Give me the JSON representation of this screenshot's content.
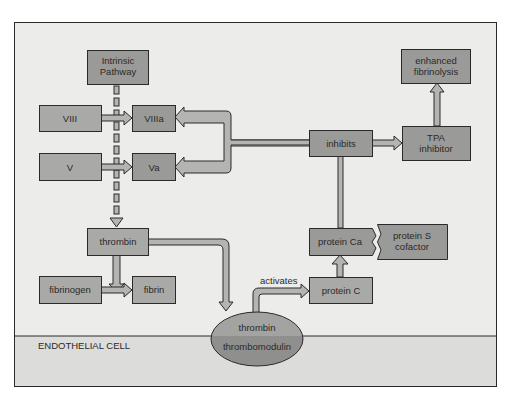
{
  "diagram": {
    "colors": {
      "background": "#ffffff",
      "panel": "#ececea",
      "endothelial_region": "#dcdcda",
      "box_fill": "#9a9a98",
      "box_fill_light": "#a9a9a7",
      "arrow_fill": "#b4b4b2",
      "stroke": "#2a2a2a",
      "ellipse_top": "#a3a3a1",
      "ellipse_bottom": "#8f8f8d"
    },
    "nodes": {
      "intrinsic_pathway": {
        "line1": "Intrinsic",
        "line2": "Pathway"
      },
      "viii": {
        "label": "VIII"
      },
      "viiia": {
        "label": "VIIIa"
      },
      "v": {
        "label": "V"
      },
      "va": {
        "label": "Va"
      },
      "thrombin": {
        "label": "thrombin"
      },
      "fibrinogen": {
        "label": "fibrinogen"
      },
      "fibrin": {
        "label": "fibrin"
      },
      "thrombin_complex": {
        "top": "thrombin",
        "bottom": "thrombomodulin"
      },
      "protein_c": {
        "label": "protein C"
      },
      "protein_ca": {
        "label": "protein Ca"
      },
      "protein_s": {
        "line1": "protein S",
        "line2": "cofactor"
      },
      "inhibits": {
        "label": "inhibits"
      },
      "tpa_inhibitor": {
        "line1": "TPA",
        "line2": "inhibitor"
      },
      "enhanced_fibrinolysis": {
        "line1": "enhanced",
        "line2": "fibrinolysis"
      }
    },
    "edge_labels": {
      "activates": "activates"
    },
    "regions": {
      "endothelial_cell": "ENDOTHELIAL CELL"
    },
    "edges": [
      {
        "from": "intrinsic_pathway",
        "to": "thrombin",
        "style": "dashed"
      },
      {
        "from": "viii",
        "to": "viiia"
      },
      {
        "from": "v",
        "to": "va"
      },
      {
        "from": "thrombin",
        "to": "fibrin"
      },
      {
        "from": "fibrinogen",
        "to": "fibrin"
      },
      {
        "from": "thrombin",
        "to": "thrombin_complex"
      },
      {
        "from": "thrombin_complex",
        "to": "protein_c",
        "label": "activates"
      },
      {
        "from": "protein_c",
        "to": "protein_ca"
      },
      {
        "from": "protein_s",
        "to": "protein_ca"
      },
      {
        "from": "protein_ca",
        "to": "inhibits"
      },
      {
        "from": "inhibits",
        "to": "viiia"
      },
      {
        "from": "inhibits",
        "to": "va"
      },
      {
        "from": "inhibits",
        "to": "tpa_inhibitor"
      },
      {
        "from": "tpa_inhibitor",
        "to": "enhanced_fibrinolysis"
      }
    ]
  }
}
